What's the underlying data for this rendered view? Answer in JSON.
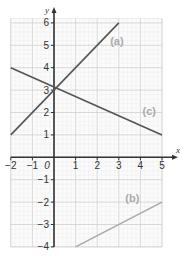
{
  "chart_data": {
    "type": "line",
    "title": "",
    "xlabel": "x",
    "ylabel": "y",
    "xlim": [
      -2,
      5
    ],
    "ylim": [
      -4,
      6
    ],
    "grid": true,
    "origin_label": "0",
    "x_ticks": [
      "-2",
      "-1",
      "1",
      "2",
      "3",
      "4",
      "5"
    ],
    "y_ticks": [
      "6",
      "5",
      "4",
      "3",
      "2",
      "1",
      "-1",
      "-2",
      "-3",
      "-4"
    ],
    "series": [
      {
        "name": "(a)",
        "x": [
          -2,
          3
        ],
        "y": [
          1,
          6
        ],
        "color": "#555555",
        "label_pos": [
          2.6,
          5
        ]
      },
      {
        "name": "(b)",
        "x": [
          1,
          5
        ],
        "y": [
          -4,
          -2
        ],
        "color": "#aaaaaa",
        "label_pos": [
          3.3,
          -2
        ]
      },
      {
        "name": "(c)",
        "x": [
          -2,
          5
        ],
        "y": [
          4,
          1
        ],
        "color": "#555555",
        "label_pos": [
          4.1,
          1.9
        ]
      }
    ]
  }
}
